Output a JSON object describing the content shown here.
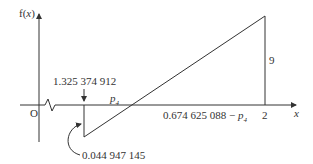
{
  "diagram": {
    "y_axis_label_prefix": "f(",
    "y_axis_label_var": "x",
    "y_axis_label_suffix": ")",
    "x_axis_label": "x",
    "origin_label": "O",
    "top_annotation": "1.325 374 912",
    "bottom_annotation": "0.044 947 145",
    "p_label_base": "p",
    "p_label_sub": "4",
    "segment_label_prefix": "0.674 625 088 − ",
    "segment_label_p": "p",
    "segment_label_sub": "4",
    "x_tick_label": "2",
    "height_label": "9",
    "colors": {
      "line": "#333333",
      "background": "#ffffff"
    }
  }
}
